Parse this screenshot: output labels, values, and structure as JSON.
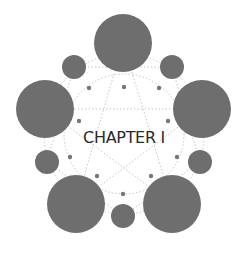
{
  "title": "CHAPTER I",
  "colors": {
    "circle": "#6e6e6e",
    "dot": "#777777",
    "line": "#b8b8b8",
    "text": "#2a2a2a",
    "background": "#ffffff"
  },
  "large_circles": [
    {
      "name": "top"
    },
    {
      "name": "left"
    },
    {
      "name": "right"
    },
    {
      "name": "bottom-left"
    },
    {
      "name": "bottom-right"
    }
  ],
  "small_circles": [
    {
      "name": "top-left"
    },
    {
      "name": "top-right"
    },
    {
      "name": "left"
    },
    {
      "name": "right"
    },
    {
      "name": "bottom"
    }
  ],
  "dot_count": 10
}
